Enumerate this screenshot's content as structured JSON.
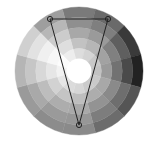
{
  "color_wheel": {
    "center": [
      79,
      71
    ],
    "radius": 64,
    "inner_radius": 12,
    "center_color": "#ffffff",
    "sectors": 12,
    "start_angle_deg": -105,
    "rings": [
      [
        "#7a7a7a",
        "#6a6a6a",
        "#3a3a3a",
        "#222222",
        "#555555",
        "#6c6c6c",
        "#8a8a8a",
        "#8c8c8c",
        "#9a9a9a",
        "#b5b5b5",
        "#d0d0d0",
        "#9e9e9e"
      ],
      [
        "#8f8f8f",
        "#7f7f7f",
        "#5f5f5f",
        "#4a4a4a",
        "#6e6e6e",
        "#7d7d7d",
        "#979797",
        "#9a9a9a",
        "#a9a9a9",
        "#c6c6c6",
        "#e2e2e2",
        "#b7b7b7"
      ],
      [
        "#a8a8a8",
        "#9a9a9a",
        "#808080",
        "#727272",
        "#8a8a8a",
        "#939393",
        "#a9a9a9",
        "#adadad",
        "#bdbdbd",
        "#d8d8d8",
        "#f0f0f0",
        "#cccccc"
      ],
      [
        "#c2c2c2",
        "#b6b6b6",
        "#a2a2a2",
        "#9a9a9a",
        "#a8a8a8",
        "#adadad",
        "#bebebe",
        "#c4c4c4",
        "#d2d2d2",
        "#e6e6e6",
        "#f7f7f7",
        "#dedede"
      ],
      [
        "#dddddd",
        "#d4d4d4",
        "#c8c8c8",
        "#c2c2c2",
        "#c9c9c9",
        "#cbcbcb",
        "#d6d6d6",
        "#dbdbdb",
        "#e6e6e6",
        "#f2f2f2",
        "#fcfcfc",
        "#ededed"
      ]
    ]
  },
  "harmony_triangle": {
    "stroke": "#222222",
    "points": [
      {
        "id": "handle-top-left",
        "x": 50,
        "y": 19
      },
      {
        "id": "handle-top-right",
        "x": 108,
        "y": 19
      },
      {
        "id": "handle-bottom",
        "x": 79,
        "y": 125
      }
    ]
  }
}
